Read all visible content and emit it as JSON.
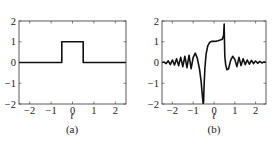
{
  "chart_data": [
    {
      "id": "a",
      "type": "line",
      "caption": "(a)",
      "title": "",
      "xlabel": "t",
      "ylabel": "",
      "xlim": [
        -2.5,
        2.5
      ],
      "ylim": [
        -2,
        2
      ],
      "xticks": [
        -2,
        -1,
        0,
        1,
        2
      ],
      "xtick_labels": [
        "−2",
        "−1",
        "0",
        "1",
        "2"
      ],
      "yticks": [
        -2,
        -1,
        0,
        1,
        2
      ],
      "ytick_labels": [
        "−2",
        "−1",
        "0",
        "1",
        "2"
      ],
      "grid": false,
      "series": [
        {
          "name": "rectangular pulse",
          "x": [
            -2.5,
            -0.5,
            -0.5,
            0.5,
            0.5,
            2.5
          ],
          "y": [
            0,
            0,
            1,
            1,
            0,
            0
          ]
        }
      ]
    },
    {
      "id": "b",
      "type": "line",
      "caption": "(b)",
      "title": "",
      "xlabel": "t",
      "ylabel": "",
      "xlim": [
        -2.5,
        2.5
      ],
      "ylim": [
        -2,
        2
      ],
      "xticks": [
        -2,
        -1,
        0,
        1,
        2
      ],
      "xtick_labels": [
        "−2",
        "−1",
        "0",
        "1",
        "2"
      ],
      "yticks": [
        -2,
        -1,
        0,
        1,
        2
      ],
      "ytick_labels": [
        "−2",
        "−1",
        "0",
        "1",
        "2"
      ],
      "grid": false,
      "series": [
        {
          "name": "response with ringing",
          "x": [
            -2.5,
            -2.4,
            -2.3,
            -2.2,
            -2.1,
            -2.0,
            -1.9,
            -1.8,
            -1.7,
            -1.6,
            -1.5,
            -1.4,
            -1.3,
            -1.2,
            -1.1,
            -1.0,
            -0.9,
            -0.8,
            -0.7,
            -0.62,
            -0.56,
            -0.52,
            -0.5,
            -0.48,
            -0.44,
            -0.38,
            -0.3,
            -0.2,
            -0.1,
            0.0,
            0.1,
            0.2,
            0.3,
            0.4,
            0.46,
            0.49,
            0.5,
            0.52,
            0.56,
            0.62,
            0.7,
            0.8,
            0.9,
            1.0,
            1.1,
            1.2,
            1.3,
            1.4,
            1.5,
            1.6,
            1.7,
            1.8,
            1.9,
            2.0,
            2.1,
            2.2,
            2.3,
            2.4,
            2.5
          ],
          "y": [
            0.0,
            0.02,
            -0.05,
            0.08,
            -0.1,
            0.12,
            -0.12,
            0.18,
            -0.15,
            0.25,
            -0.2,
            0.3,
            -0.25,
            0.35,
            -0.3,
            0.25,
            0.45,
            0.2,
            -0.3,
            -0.9,
            -1.6,
            -2.0,
            -1.9,
            -1.2,
            -0.3,
            0.4,
            0.8,
            0.98,
            1.02,
            1.02,
            1.03,
            1.05,
            1.08,
            1.12,
            1.3,
            1.85,
            1.2,
            0.3,
            -0.1,
            -0.35,
            -0.3,
            0.1,
            0.3,
            0.15,
            -0.2,
            0.25,
            -0.15,
            0.18,
            -0.1,
            0.12,
            -0.08,
            0.1,
            -0.05,
            0.07,
            -0.04,
            0.05,
            -0.02,
            0.03,
            0.0
          ]
        }
      ]
    }
  ],
  "panels": {
    "a": {
      "caption": "(a)",
      "xlabel": "t"
    },
    "b": {
      "caption": "(b)",
      "xlabel": "t"
    }
  }
}
